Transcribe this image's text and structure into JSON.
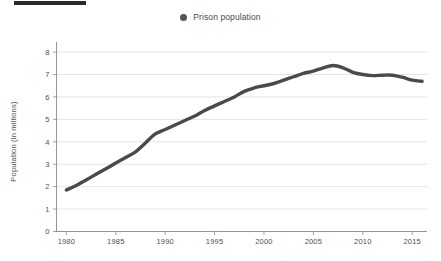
{
  "page": {
    "redaction_bar": "redacted-black-bar"
  },
  "legend": {
    "position": "top-center",
    "marker_icon": "filled-circle-marker",
    "entries": [
      {
        "label": "Prison population",
        "color": "#555555"
      }
    ]
  },
  "chart_data": {
    "type": "line",
    "title": "",
    "subtitle": "",
    "xlabel": "",
    "ylabel": "Population (in millions)",
    "xlim": [
      1979,
      2016.5
    ],
    "ylim": [
      0,
      8.45
    ],
    "grid": true,
    "legend_position": "top-center",
    "x_tick_labels": [
      "1980",
      "1985",
      "1990",
      "1995",
      "2000",
      "2005",
      "2010",
      "2015"
    ],
    "x_ticks": [
      1980,
      1985,
      1990,
      1995,
      2000,
      2005,
      2010,
      2015
    ],
    "y_tick_labels": [
      "0",
      "1",
      "2",
      "3",
      "4",
      "5",
      "6",
      "7",
      "8"
    ],
    "y_ticks": [
      0,
      1,
      2,
      3,
      4,
      5,
      6,
      7,
      8
    ],
    "series": [
      {
        "name": "Prison population",
        "color": "#4a4a4a",
        "x": [
          1980,
          1981,
          1982,
          1983,
          1984,
          1985,
          1986,
          1987,
          1988,
          1989,
          1990,
          1991,
          1992,
          1993,
          1994,
          1995,
          1996,
          1997,
          1998,
          1999,
          2000,
          2001,
          2002,
          2003,
          2004,
          2005,
          2006,
          2007,
          2008,
          2009,
          2010,
          2011,
          2012,
          2013,
          2014,
          2015,
          2016
        ],
        "values": [
          1.85,
          2.05,
          2.3,
          2.55,
          2.8,
          3.05,
          3.3,
          3.55,
          3.95,
          4.35,
          4.55,
          4.75,
          4.95,
          5.15,
          5.4,
          5.6,
          5.8,
          6.0,
          6.25,
          6.4,
          6.5,
          6.6,
          6.75,
          6.9,
          7.05,
          7.15,
          7.3,
          7.4,
          7.3,
          7.1,
          7.0,
          6.95,
          6.97,
          6.97,
          6.88,
          6.75,
          6.7
        ]
      }
    ]
  }
}
